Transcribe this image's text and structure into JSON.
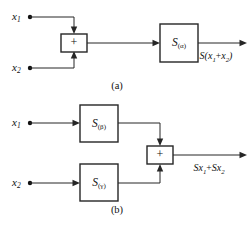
{
  "figure": {
    "line_color": "#262626",
    "text_color": "#111111",
    "background": "#ffffff",
    "captions": [
      {
        "id": "caption-a",
        "text": "(a)"
      },
      {
        "id": "caption-b",
        "text": "(b)"
      }
    ]
  },
  "diagram_a": {
    "caption": "(a)",
    "inputs": [
      {
        "name": "input-x1",
        "base": "x",
        "subscript": "1"
      },
      {
        "name": "input-x2",
        "base": "x",
        "subscript": "2"
      }
    ],
    "summer": {
      "name": "summing-junction",
      "symbol": "+"
    },
    "system_block": {
      "name": "system-block-alpha",
      "base": "S",
      "subscript": "(α)"
    },
    "output": {
      "name": "output-label-a",
      "parts": [
        {
          "text": "S(",
          "type": "base"
        },
        {
          "text": "x",
          "type": "var"
        },
        {
          "text": "1",
          "type": "sub"
        },
        {
          "text": "+",
          "type": "op"
        },
        {
          "text": "x",
          "type": "var"
        },
        {
          "text": "2",
          "type": "sub"
        },
        {
          "text": ")",
          "type": "base"
        }
      ],
      "plain": "S(x1+x2)"
    }
  },
  "diagram_b": {
    "caption": "(b)",
    "inputs": [
      {
        "name": "input-x1",
        "base": "x",
        "subscript": "1"
      },
      {
        "name": "input-x2",
        "base": "x",
        "subscript": "2"
      }
    ],
    "system_blocks": [
      {
        "name": "system-block-beta",
        "base": "S",
        "subscript": "(β)"
      },
      {
        "name": "system-block-gamma",
        "base": "S",
        "subscript": "(γ)"
      }
    ],
    "summer": {
      "name": "summing-junction",
      "symbol": "+"
    },
    "output": {
      "name": "output-label-b",
      "parts": [
        {
          "text": "S",
          "type": "base"
        },
        {
          "text": "x",
          "type": "var"
        },
        {
          "text": "1",
          "type": "sub"
        },
        {
          "text": "+",
          "type": "op"
        },
        {
          "text": "S",
          "type": "base"
        },
        {
          "text": "x",
          "type": "var"
        },
        {
          "text": "2",
          "type": "sub"
        }
      ],
      "plain": "Sx1+Sx2"
    }
  }
}
